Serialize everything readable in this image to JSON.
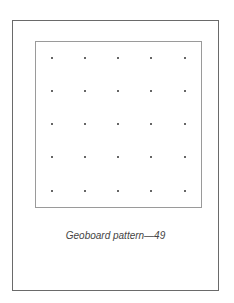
{
  "figure": {
    "caption": "Geoboard pattern—49",
    "grid": {
      "rows": 5,
      "cols": 5,
      "peg_x": [
        52,
        85,
        118,
        151,
        185
      ],
      "peg_y": [
        58,
        91,
        124,
        157,
        191
      ],
      "peg_color": "#333333"
    },
    "frame_color": "#6a6a6a",
    "board_color": "#9a9a9a"
  }
}
